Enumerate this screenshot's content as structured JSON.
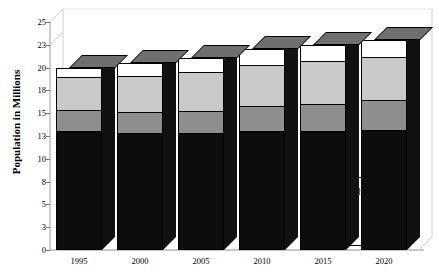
{
  "chart_data": {
    "type": "bar",
    "stacked": true,
    "title": "",
    "xlabel": "",
    "ylabel": "Population in Millions",
    "categories": [
      "1995",
      "2000",
      "2005",
      "2010",
      "2015",
      "2020"
    ],
    "series": [
      {
        "name": "White",
        "color": "#0d0d0d",
        "values": [
          13.0,
          12.8,
          12.8,
          13.0,
          13.0,
          13.2
        ]
      },
      {
        "name": "Black",
        "color": "#8e8e8e",
        "values": [
          2.4,
          2.3,
          2.4,
          2.8,
          3.0,
          3.3
        ]
      },
      {
        "name": "Hispanic",
        "color": "#c9c9c9",
        "values": [
          3.6,
          4.0,
          4.3,
          4.5,
          4.7,
          4.7
        ]
      },
      {
        "name": "Asian/Other",
        "color": "#ffffff",
        "values": [
          1.0,
          1.4,
          1.5,
          1.7,
          1.8,
          1.8
        ]
      }
    ],
    "totals": [
      20.0,
      20.5,
      21.0,
      22.0,
      22.5,
      23.0
    ],
    "ylim": [
      0,
      25
    ],
    "yticks": [
      "0",
      "3",
      "5",
      "8",
      "10",
      "13",
      "15",
      "18",
      "20",
      "23",
      "25"
    ],
    "ytick_values": [
      0,
      2.5,
      5,
      7.5,
      10,
      12.5,
      15,
      17.5,
      20,
      22.5,
      25
    ],
    "grid": false,
    "legend_position": "inside-bottom-right",
    "legend_entries": [
      {
        "label": "Asian/Other",
        "color": "#ffffff"
      },
      {
        "label": "Hispanic",
        "color": "#d8d8d8"
      },
      {
        "label": "Black",
        "color": "#8e8e8e"
      },
      {
        "label": "White",
        "color": "#0d0d0d"
      }
    ],
    "style": "3d-stacked-column",
    "background": "#ffffff"
  }
}
